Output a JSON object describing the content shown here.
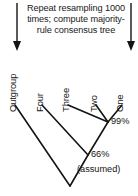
{
  "figure": {
    "name": "majority-rule-consensus-tree",
    "background": "#ffffff",
    "ink_color": "#141414"
  },
  "caption": {
    "lines": [
      "Repeat resampling 1000",
      "times; compute majority-",
      "rule consensus tree"
    ]
  },
  "arrows": [
    {
      "name": "left-down-arrow",
      "x": 17,
      "y_start": 3,
      "y_end": 50
    },
    {
      "name": "right-down-arrow",
      "x": 131,
      "y_start": 3,
      "y_end": 50
    }
  ],
  "tips": [
    {
      "label": "Outgroup",
      "x": 15,
      "label_x": 18,
      "label_y": 101
    },
    {
      "label": "Four",
      "x": 42,
      "label_x": 45,
      "label_y": 101
    },
    {
      "label": "Three",
      "x": 68,
      "label_x": 71,
      "label_y": 101
    },
    {
      "label": "Two",
      "x": 96,
      "label_x": 99,
      "label_y": 101
    },
    {
      "label": "One",
      "x": 122,
      "label_x": 125,
      "label_y": 101
    }
  ],
  "tree": {
    "tip_y": 105,
    "root": {
      "x": 70,
      "y": 186
    },
    "nodes": [
      {
        "name": "two-one-node",
        "x": 108,
        "y": 122
      },
      {
        "name": "three-two-one-node",
        "x": 88,
        "y": 155
      },
      {
        "name": "four-clade-node",
        "x": 70,
        "y": 186
      }
    ]
  },
  "support_labels": [
    {
      "name": "support-99",
      "text": "99%",
      "x": 111,
      "y": 116
    },
    {
      "name": "support-66",
      "text": "66%",
      "x": 91,
      "y": 149
    },
    {
      "name": "root-assumed",
      "text": "(assumed)",
      "x": 77,
      "y": 164
    }
  ]
}
